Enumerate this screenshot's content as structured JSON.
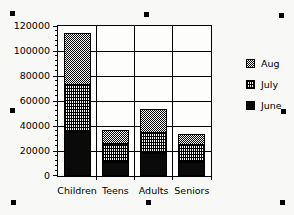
{
  "chart_data": {
    "type": "bar",
    "stacked": true,
    "title": "",
    "xlabel": "",
    "ylabel": "",
    "categories": [
      "Children",
      "Teens",
      "Adults",
      "Seniors"
    ],
    "series": [
      {
        "name": "June",
        "pattern": "solid",
        "values": [
          35000,
          11000,
          18500,
          11000
        ]
      },
      {
        "name": "July",
        "pattern": "grid",
        "values": [
          37500,
          14500,
          16000,
          14000
        ]
      },
      {
        "name": "Aug",
        "pattern": "checker",
        "values": [
          42000,
          11000,
          19000,
          9000
        ]
      }
    ],
    "ylim": [
      0,
      120000
    ],
    "yticks": [
      0,
      20000,
      40000,
      60000,
      80000,
      100000,
      120000
    ],
    "minor_tick_step": 4000,
    "grid": true,
    "legend": {
      "position": "right",
      "order": [
        "Aug",
        "July",
        "June"
      ]
    }
  },
  "selection": {
    "handle_color": "#000000",
    "handles": [
      "top-left",
      "top-center",
      "top-right",
      "middle-left",
      "middle-right",
      "bottom-left",
      "bottom-center",
      "bottom-right"
    ]
  },
  "colors": {
    "background": "#f8f8f6",
    "plot_background": "#fdfdfc",
    "ink": "#000000"
  }
}
